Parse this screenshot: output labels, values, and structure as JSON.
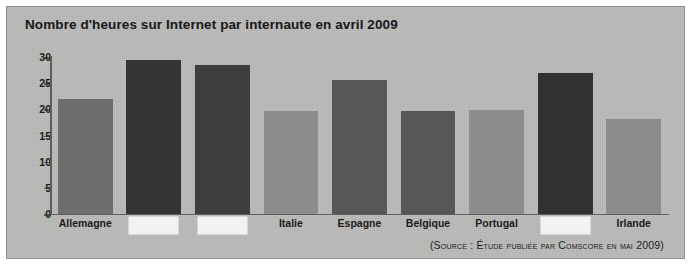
{
  "figure": {
    "background_color": "#b9b9b7",
    "border_color": "#8e8e8c",
    "axis_color": "#5d5d5c",
    "redaction_color": "#f2f2f0"
  },
  "source_note": "(Source : Étude publiée par Comscore en mai 2009)",
  "chart_data": {
    "type": "bar",
    "title": "Nombre d'heures sur Internet par internaute en avril 2009",
    "xlabel": "",
    "ylabel": "",
    "ylim": [
      0,
      30
    ],
    "yticks": [
      0,
      5,
      10,
      15,
      20,
      25,
      30
    ],
    "ytick_labels": [
      "0",
      "5",
      "10",
      "15",
      "20",
      "25",
      "30"
    ],
    "grid": false,
    "legend": "none",
    "categories": [
      "Allemagne",
      "",
      "",
      "Italie",
      "Espagne",
      "Belgique",
      "Portugal",
      "",
      "Irlande"
    ],
    "category_redacted": [
      false,
      true,
      true,
      false,
      false,
      false,
      false,
      true,
      false
    ],
    "values": [
      22.0,
      29.5,
      28.5,
      19.7,
      25.6,
      19.7,
      19.8,
      27.0,
      18.2
    ],
    "bar_colors": [
      "#6e6e6e",
      "#333335",
      "#3e3e40",
      "#8c8c8a",
      "#575759",
      "#575759",
      "#8c8c8a",
      "#313133",
      "#8c8c8a"
    ]
  }
}
